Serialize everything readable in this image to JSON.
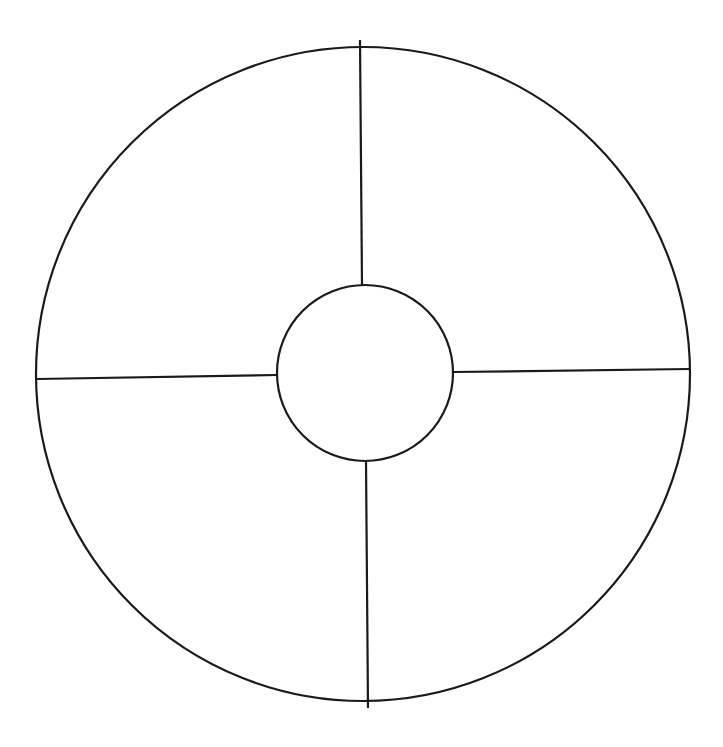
{
  "diagram": {
    "type": "circle-divided-into-quadrants",
    "canvas": {
      "width": 723,
      "height": 747,
      "background": "#ffffff"
    },
    "stroke_color": "#1a1a1a",
    "stroke_width": 2.2,
    "outer_circle": {
      "cx": 363,
      "cy": 374,
      "r": 327
    },
    "inner_circle": {
      "cx": 365,
      "cy": 373,
      "r": 88
    },
    "dividers": [
      {
        "name": "top",
        "x1": 360,
        "y1": 40,
        "x2": 362,
        "y2": 285
      },
      {
        "name": "right",
        "x1": 453,
        "y1": 372,
        "x2": 689,
        "y2": 369
      },
      {
        "name": "bottom",
        "x1": 366,
        "y1": 461,
        "x2": 368,
        "y2": 708
      },
      {
        "name": "left",
        "x1": 37,
        "y1": 379,
        "x2": 277,
        "y2": 375
      }
    ],
    "segments": [
      "top-left",
      "top-right",
      "bottom-left",
      "bottom-right"
    ],
    "labels": []
  }
}
